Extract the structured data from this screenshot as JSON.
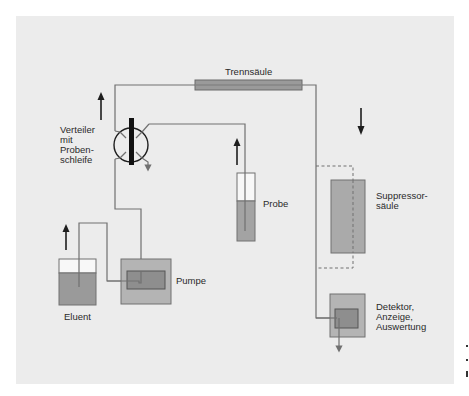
{
  "diagram": {
    "type": "flow-schematic",
    "colors": {
      "panel_bg": "#ececec",
      "line": "#707070",
      "fill_medium": "#a3a3a3",
      "fill_light": "#c4c4c4",
      "fill_dark": "#8a8a8a",
      "arrow": "#1e1e1e",
      "text": "#2a2a2a"
    },
    "labels": {
      "column": "Trennsäule",
      "valve_line1": "Verteiler",
      "valve_line2": "mit",
      "valve_line3": "Proben-",
      "valve_line4": "schleife",
      "sample": "Probe",
      "suppressor_line1": "Suppressor-",
      "suppressor_line2": "säule",
      "eluent": "Eluent",
      "pump": "Pumpe",
      "detector_line1": "Detektor,",
      "detector_line2": "Anzeige,",
      "detector_line3": "Auswertung"
    },
    "components": [
      {
        "id": "eluent",
        "label": "Eluent"
      },
      {
        "id": "pump",
        "label": "Pumpe"
      },
      {
        "id": "valve",
        "label": "Verteiler mit Probenschleife"
      },
      {
        "id": "sample",
        "label": "Probe"
      },
      {
        "id": "column",
        "label": "Trennsäule"
      },
      {
        "id": "suppressor",
        "label": "Suppressorsäule"
      },
      {
        "id": "detector",
        "label": "Detektor, Anzeige, Auswertung"
      }
    ],
    "flow": [
      "eluent",
      "pump",
      "valve",
      "column",
      "suppressor",
      "detector"
    ],
    "sample_flow": [
      "sample",
      "valve"
    ]
  }
}
